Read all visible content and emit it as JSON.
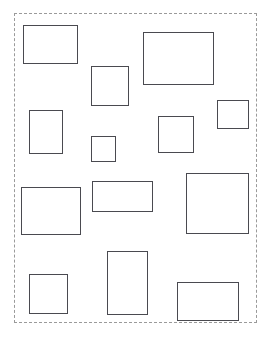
{
  "canvas": {
    "width": 274,
    "height": 346,
    "background_color": "#ffffff",
    "title": "Rectangle Layout Canvas"
  },
  "frame": {
    "name": "dashed-boundary",
    "x": 14,
    "y": 13,
    "width": 243,
    "height": 310,
    "border_style": "dashed",
    "border_width": 1,
    "border_color": "#9a9a9a",
    "fill": "none"
  },
  "shapes": {
    "count": 13,
    "stroke_color": "#4a4a50",
    "stroke_width": 1,
    "fill_color": "#ffffff",
    "items": [
      {
        "id": "rect-1",
        "label": "rect-1",
        "x": 23,
        "y": 25,
        "width": 55,
        "height": 39,
        "area": 2145
      },
      {
        "id": "rect-2",
        "label": "rect-2",
        "x": 143,
        "y": 32,
        "width": 71,
        "height": 53,
        "area": 3763
      },
      {
        "id": "rect-3",
        "label": "rect-3",
        "x": 91,
        "y": 66,
        "width": 38,
        "height": 40,
        "area": 1520
      },
      {
        "id": "rect-4",
        "label": "rect-4",
        "x": 29,
        "y": 110,
        "width": 34,
        "height": 44,
        "area": 1496
      },
      {
        "id": "rect-5",
        "label": "rect-5",
        "x": 217,
        "y": 100,
        "width": 32,
        "height": 29,
        "area": 928
      },
      {
        "id": "rect-6",
        "label": "rect-6",
        "x": 91,
        "y": 136,
        "width": 25,
        "height": 26,
        "area": 650
      },
      {
        "id": "rect-7",
        "label": "rect-7",
        "x": 158,
        "y": 116,
        "width": 36,
        "height": 37,
        "area": 1332
      },
      {
        "id": "rect-8",
        "label": "rect-8",
        "x": 21,
        "y": 187,
        "width": 60,
        "height": 48,
        "area": 2880
      },
      {
        "id": "rect-9",
        "label": "rect-9",
        "x": 92,
        "y": 181,
        "width": 61,
        "height": 31,
        "area": 1891
      },
      {
        "id": "rect-10",
        "label": "rect-10",
        "x": 186,
        "y": 173,
        "width": 63,
        "height": 61,
        "area": 3843
      },
      {
        "id": "rect-11",
        "label": "rect-11",
        "x": 29,
        "y": 274,
        "width": 39,
        "height": 40,
        "area": 1560
      },
      {
        "id": "rect-12",
        "label": "rect-12",
        "x": 107,
        "y": 251,
        "width": 41,
        "height": 64,
        "area": 2624
      },
      {
        "id": "rect-13",
        "label": "rect-13",
        "x": 177,
        "y": 282,
        "width": 62,
        "height": 39,
        "area": 2418
      }
    ]
  }
}
